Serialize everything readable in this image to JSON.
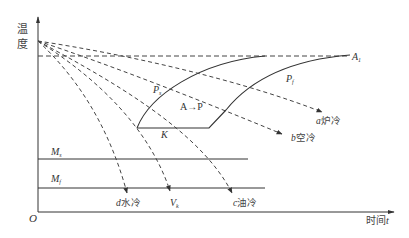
{
  "diagram": {
    "title": "",
    "axes": {
      "y_label_line1": "温",
      "y_label_line2": "度",
      "x_label": "时间",
      "x_label_var": "t",
      "origin": "O"
    },
    "reference_lines": {
      "a1": {
        "label": "A",
        "sub": "1"
      },
      "ms": {
        "label": "M",
        "sub": "s"
      },
      "mf": {
        "label": "M",
        "sub": "f"
      }
    },
    "curves": {
      "ps": {
        "label": "P",
        "sub": "s"
      },
      "pf": {
        "label": "P",
        "sub": "f"
      },
      "k": {
        "label": "K"
      },
      "region": {
        "label": "A→P"
      }
    },
    "cooling_curves": [
      {
        "id": "a",
        "letter": "a",
        "label": "炉冷"
      },
      {
        "id": "b",
        "letter": "b",
        "label": "空冷"
      },
      {
        "id": "c",
        "letter": "c",
        "label": "油冷"
      },
      {
        "id": "vk",
        "letter": "V",
        "sub": "k",
        "label": ""
      },
      {
        "id": "d",
        "letter": "d",
        "label": "水冷"
      }
    ],
    "colors": {
      "line": "#333333",
      "dash": "#444444",
      "background": "#ffffff"
    }
  }
}
